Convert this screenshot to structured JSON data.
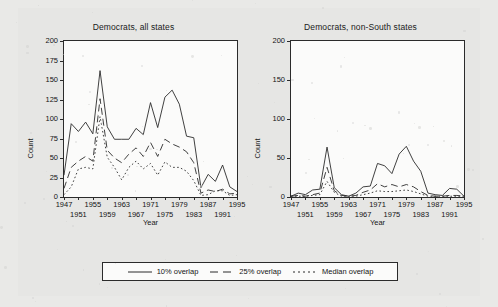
{
  "figure": {
    "background_color": "#e8e8e8",
    "panel_background": "#fbfbfa",
    "line_color": "#2b2b2b"
  },
  "panels": [
    {
      "id": "all-states",
      "title": "Democrats, all states",
      "xlabel": "Year",
      "ylabel": "Count"
    },
    {
      "id": "non-south-states",
      "title": "Democrats, non-South states",
      "xlabel": "Year",
      "ylabel": "Count"
    }
  ],
  "legend": {
    "position": "bottom-center",
    "entries": [
      {
        "label": "10% overlap",
        "style": "solid"
      },
      {
        "label": "25% overlap",
        "style": "dashed"
      },
      {
        "label": "Median overlap",
        "style": "dotted"
      }
    ]
  },
  "chart_data": [
    {
      "type": "line",
      "title": "Democrats, all states",
      "xlabel": "Year",
      "ylabel": "Count",
      "xlim": [
        1947,
        1995
      ],
      "ylim": [
        0,
        200
      ],
      "yticks": [
        0,
        25,
        50,
        75,
        100,
        125,
        150,
        175,
        200
      ],
      "xticks": [
        1947,
        1951,
        1955,
        1959,
        1963,
        1967,
        1971,
        1975,
        1979,
        1983,
        1987,
        1991,
        1995
      ],
      "xtick_rows": {
        "top": [
          1947,
          1955,
          1963,
          1971,
          1979,
          1987,
          1995
        ],
        "bottom": [
          1951,
          1959,
          1967,
          1975,
          1983,
          1991
        ]
      },
      "grid": false,
      "legend_position": "below",
      "x": [
        1947,
        1949,
        1951,
        1953,
        1955,
        1957,
        1959,
        1961,
        1963,
        1965,
        1967,
        1969,
        1971,
        1973,
        1975,
        1977,
        1979,
        1981,
        1983,
        1985,
        1987,
        1989,
        1991,
        1993,
        1995
      ],
      "series": [
        {
          "name": "10% overlap",
          "style": "solid",
          "values": [
            28,
            94,
            84,
            96,
            81,
            162,
            90,
            74,
            74,
            74,
            88,
            80,
            121,
            89,
            128,
            137,
            119,
            78,
            76,
            12,
            29,
            20,
            41,
            13,
            7
          ]
        },
        {
          "name": "25% overlap",
          "style": "dashed",
          "values": [
            11,
            38,
            46,
            52,
            46,
            126,
            60,
            50,
            44,
            55,
            63,
            52,
            70,
            52,
            74,
            68,
            64,
            58,
            44,
            5,
            9,
            7,
            10,
            4,
            5
          ]
        },
        {
          "name": "Median overlap",
          "style": "dotted",
          "values": [
            3,
            13,
            36,
            38,
            36,
            103,
            51,
            38,
            22,
            38,
            46,
            36,
            43,
            28,
            45,
            38,
            38,
            33,
            21,
            2,
            3,
            8,
            8,
            2,
            3
          ]
        }
      ]
    },
    {
      "type": "line",
      "title": "Democrats, non-South states",
      "xlabel": "Year",
      "ylabel": "Count",
      "xlim": [
        1947,
        1995
      ],
      "ylim": [
        0,
        200
      ],
      "yticks": [
        0,
        50,
        100,
        150,
        200
      ],
      "xticks": [
        1947,
        1951,
        1955,
        1959,
        1963,
        1967,
        1971,
        1975,
        1979,
        1983,
        1987,
        1991,
        1995
      ],
      "xtick_rows": {
        "top": [
          1947,
          1955,
          1963,
          1971,
          1979,
          1987,
          1995
        ],
        "bottom": [
          1951,
          1959,
          1967,
          1975,
          1983,
          1991
        ]
      },
      "grid": false,
      "legend_position": "below",
      "x": [
        1947,
        1949,
        1951,
        1953,
        1955,
        1957,
        1959,
        1961,
        1963,
        1965,
        1967,
        1969,
        1971,
        1973,
        1975,
        1977,
        1979,
        1981,
        1983,
        1985,
        1987,
        1989,
        1991,
        1993,
        1995
      ],
      "series": [
        {
          "name": "10% overlap",
          "style": "solid",
          "values": [
            1,
            5,
            3,
            9,
            10,
            64,
            12,
            3,
            1,
            5,
            13,
            14,
            43,
            40,
            30,
            55,
            65,
            46,
            33,
            5,
            3,
            2,
            11,
            10,
            1
          ]
        },
        {
          "name": "25% overlap",
          "style": "dashed",
          "values": [
            1,
            2,
            1,
            3,
            5,
            38,
            8,
            2,
            1,
            2,
            6,
            9,
            17,
            13,
            16,
            13,
            16,
            13,
            7,
            2,
            1,
            1,
            2,
            2,
            1
          ]
        },
        {
          "name": "Median overlap",
          "style": "dotted",
          "values": [
            1,
            1,
            1,
            2,
            3,
            20,
            6,
            1,
            1,
            1,
            3,
            5,
            8,
            7,
            7,
            8,
            9,
            7,
            4,
            1,
            1,
            1,
            1,
            1,
            1
          ]
        }
      ]
    }
  ]
}
